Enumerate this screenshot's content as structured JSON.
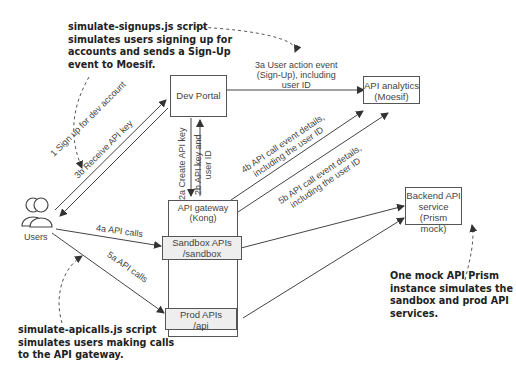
{
  "callouts": {
    "signups": "simulate-signups.js script\nsimulates users signing up for\naccounts and sends a Sign-Up\nevent to Moesif.",
    "apicalls": "simulate-apicalls.js script\nsimulates users making calls\nto the API gateway.",
    "prism": "One mock API Prism\ninstance simulates the\nsandbox and prod API\nservices."
  },
  "nodes": {
    "dev_portal": "Dev Portal",
    "analytics": "API analytics\n(Moesif)",
    "gateway": "API gateway\n(Kong)",
    "sandbox": "Sandbox APIs\n/sandbox",
    "prod": "Prod APIs\n/api",
    "backend": "Backend API\nservice\n(Prism mock)",
    "users": "Users"
  },
  "edges": {
    "e1": "1 Sign up for dev account",
    "e3b": "3b Receive API key",
    "e2a": "2a Create API key",
    "e2b": "2b API key and\nuser ID",
    "e3a": "3a User action event\n(Sign-Up), including\nuser ID",
    "e4a": "4a API calls",
    "e5a": "5a API calls",
    "e4b": "4b API call event details,\nincluding the user ID",
    "e5b": "5b API call event details,\nincluding the user ID"
  }
}
